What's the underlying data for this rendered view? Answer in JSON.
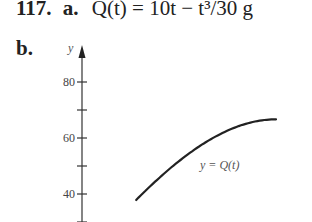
{
  "problem": {
    "number": "117.",
    "part_a_label": "a.",
    "part_a_text": "Q(t) = 10t − t³/30 g",
    "part_b_label": "b."
  },
  "chart_data": {
    "type": "line",
    "title": "",
    "xlabel": "t",
    "ylabel": "y",
    "curve_label": "y = Q(t)",
    "y_ticks": [
      80,
      70,
      60,
      50,
      40,
      30
    ],
    "y_tick_labels": [
      "80",
      "",
      "60",
      "",
      "40",
      ""
    ],
    "ylim": [
      30,
      85
    ],
    "grid": false,
    "series": [
      {
        "name": "y = Q(t)",
        "function": "10t - t^3/30",
        "x": [
          4.2,
          5,
          6,
          7,
          8,
          9,
          10
        ],
        "values": [
          39.5,
          45.8,
          52.8,
          58.6,
          62.9,
          65.7,
          66.7
        ]
      }
    ]
  }
}
